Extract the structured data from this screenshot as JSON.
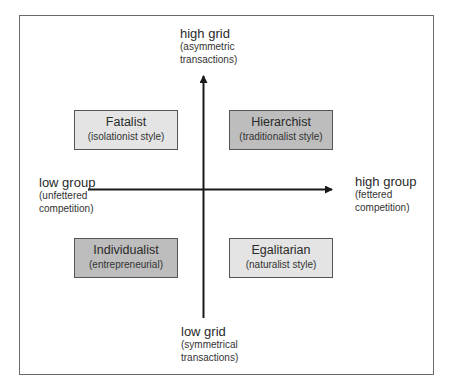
{
  "diagram": {
    "axes": {
      "vertical": {
        "top": {
          "title": "high grid",
          "subtitle_line1": "(asymmetric",
          "subtitle_line2": "transactions)"
        },
        "bottom": {
          "title": "low grid",
          "subtitle_line1": "(symmetrical",
          "subtitle_line2": "transactions)"
        }
      },
      "horizontal": {
        "left": {
          "title": "low group",
          "subtitle_line1": "(unfettered",
          "subtitle_line2": "competition)"
        },
        "right": {
          "title": "high group",
          "subtitle_line1": "(fettered",
          "subtitle_line2": "competition)"
        }
      }
    },
    "quadrants": {
      "top_left": {
        "title": "Fatalist",
        "subtitle": "(isolationist style)",
        "fill": "#e4e4e4"
      },
      "top_right": {
        "title": "Hierarchist",
        "subtitle": "(traditionalist style)",
        "fill": "#bdbdbd"
      },
      "bottom_left": {
        "title": "Individualist",
        "subtitle": "(entrepreneurial)",
        "fill": "#bdbdbd"
      },
      "bottom_right": {
        "title": "Egalitarian",
        "subtitle": "(naturalist style)",
        "fill": "#e4e4e4"
      }
    }
  }
}
